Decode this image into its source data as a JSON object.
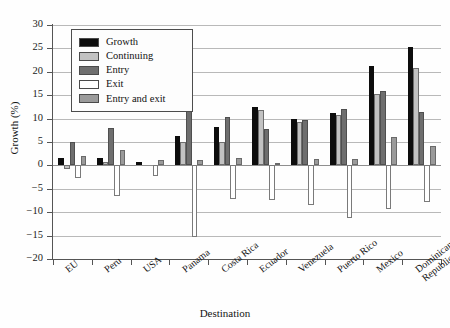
{
  "chart_data": {
    "type": "bar",
    "title": "",
    "xlabel": "Destination",
    "ylabel": "Growth (%)",
    "ylim": [
      -20,
      30
    ],
    "ytick_step": 5,
    "yticks": [
      30,
      25,
      20,
      15,
      10,
      5,
      0,
      -5,
      -10,
      -15,
      -20
    ],
    "ytick_labels": [
      "30",
      "25",
      "20",
      "15",
      "10",
      "5",
      "0",
      "−5",
      "−10",
      "−15",
      "−20"
    ],
    "grid": true,
    "legend_position": "upper-left-inside",
    "categories": [
      "EU",
      "Peru",
      "USA",
      "Panama",
      "Costa Rica",
      "Ecuador",
      "Venezuela",
      "Puerto Rico",
      "Mexico",
      "Dominican Republic"
    ],
    "category_lines": [
      [
        "EU"
      ],
      [
        "Peru"
      ],
      [
        "USA"
      ],
      [
        "Panama"
      ],
      [
        "Costa Rica"
      ],
      [
        "Ecuador"
      ],
      [
        "Venezuela"
      ],
      [
        "Puerto Rico"
      ],
      [
        "Mexico"
      ],
      [
        "Dominican",
        "Republic"
      ]
    ],
    "series": [
      {
        "name": "Growth",
        "color": "#0d0d0d",
        "values": [
          1.5,
          1.6,
          0.8,
          6.2,
          8.3,
          12.4,
          9.9,
          11.2,
          21.2,
          25.2
        ]
      },
      {
        "name": "Continuing",
        "color": "#c2c2c2",
        "values": [
          -0.8,
          0.8,
          0.0,
          4.9,
          4.9,
          11.9,
          9.2,
          10.7,
          15.3,
          20.9
        ]
      },
      {
        "name": "Entry",
        "color": "#6e6e6e",
        "values": [
          4.9,
          8.0,
          0.0,
          16.4,
          10.4,
          7.7,
          9.8,
          12.1,
          15.8,
          11.5
        ]
      },
      {
        "name": "Exit",
        "color": "#ffffff",
        "values": [
          -2.6,
          -6.6,
          -2.3,
          -15.3,
          -7.2,
          -7.4,
          -8.5,
          -11.2,
          -9.4,
          -7.8
        ]
      },
      {
        "name": "Entry and exit",
        "color": "#9a9a9a",
        "values": [
          2.1,
          3.2,
          1.1,
          1.1,
          1.5,
          0.6,
          1.3,
          1.4,
          6.1,
          4.1
        ]
      }
    ]
  },
  "legend": {
    "items": [
      {
        "label": "Growth",
        "swatch_class": "c-growth"
      },
      {
        "label": "Continuing",
        "swatch_class": "c-continuing"
      },
      {
        "label": "Entry",
        "swatch_class": "c-entry"
      },
      {
        "label": "Exit",
        "swatch_class": "c-exit"
      },
      {
        "label": "Entry and exit",
        "swatch_class": "c-entryexit"
      }
    ]
  }
}
